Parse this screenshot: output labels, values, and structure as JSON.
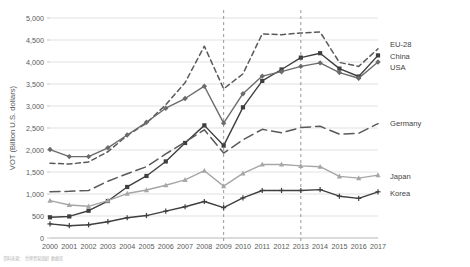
{
  "chart_data": {
    "type": "line",
    "title": "",
    "xlabel": "",
    "ylabel": "VOT (Billion U.S. dollars)",
    "ylim": [
      0,
      5000
    ],
    "ytick_step": 500,
    "yticks": [
      "0",
      "500",
      "1,000",
      "1,500",
      "2,000",
      "2,500",
      "3,000",
      "3,500",
      "4,000",
      "4,500",
      "5,000"
    ],
    "grid": true,
    "legend_position": "right-inline-labels",
    "x": [
      2000,
      2001,
      2002,
      2003,
      2004,
      2005,
      2006,
      2007,
      2008,
      2009,
      2010,
      2011,
      2012,
      2013,
      2014,
      2015,
      2016,
      2017
    ],
    "categories": [
      "2000",
      "2001",
      "2002",
      "2003",
      "2004",
      "2005",
      "2006",
      "2007",
      "2008",
      "2009",
      "2010",
      "2011",
      "2012",
      "2013",
      "2014",
      "2015",
      "2016",
      "2017"
    ],
    "annotations": [
      {
        "type": "vertical-reference-line",
        "x": 2009,
        "style": "dashed"
      },
      {
        "type": "vertical-reference-line",
        "x": 2013,
        "style": "dashed"
      }
    ],
    "series": [
      {
        "name": "EU-28",
        "style": "short-dash",
        "color": "#595959",
        "marker": "none",
        "values": [
          1700,
          1680,
          1730,
          1960,
          2330,
          2610,
          3030,
          3530,
          4360,
          3390,
          3730,
          4640,
          4620,
          4660,
          4680,
          3990,
          3900,
          4300
        ]
      },
      {
        "name": "China",
        "style": "solid",
        "color": "#3f3f3f",
        "marker": "square",
        "values": [
          470,
          490,
          620,
          840,
          1160,
          1410,
          1740,
          2160,
          2560,
          2100,
          2970,
          3570,
          3830,
          4100,
          4200,
          3850,
          3670,
          4150
        ]
      },
      {
        "name": "USA",
        "style": "solid",
        "color": "#6b6b6b",
        "marker": "diamond",
        "values": [
          2010,
          1850,
          1850,
          2050,
          2340,
          2630,
          2950,
          3170,
          3450,
          2610,
          3280,
          3680,
          3780,
          3900,
          3980,
          3760,
          3630,
          4000
        ]
      },
      {
        "name": "Germany",
        "style": "long-dash",
        "color": "#595959",
        "marker": "none",
        "values": [
          1050,
          1060,
          1080,
          1290,
          1460,
          1620,
          1910,
          2180,
          2460,
          1930,
          2230,
          2470,
          2390,
          2510,
          2540,
          2360,
          2380,
          2600
        ]
      },
      {
        "name": "Japan",
        "style": "solid",
        "color": "#a6a6a6",
        "marker": "triangle",
        "values": [
          850,
          750,
          720,
          850,
          1010,
          1090,
          1200,
          1320,
          1530,
          1180,
          1470,
          1670,
          1670,
          1640,
          1620,
          1400,
          1360,
          1430
        ]
      },
      {
        "name": "Korea",
        "style": "dash-dot",
        "color": "#3f3f3f",
        "marker": "plus",
        "values": [
          320,
          280,
          300,
          370,
          460,
          510,
          610,
          710,
          830,
          690,
          910,
          1080,
          1080,
          1080,
          1100,
          950,
          900,
          1050
        ]
      }
    ]
  },
  "caption": {
    "text": "资料来源：  世界贸易组织  数据库"
  }
}
